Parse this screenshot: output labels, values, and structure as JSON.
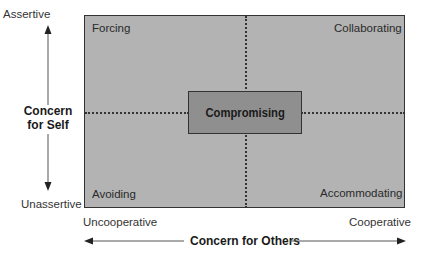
{
  "diagram": {
    "type": "conflict-modes-grid",
    "quadrants": {
      "top_left": "Forcing",
      "top_right": "Collaborating",
      "bottom_left": "Avoiding",
      "bottom_right": "Accommodating",
      "center": "Compromising"
    },
    "y_axis": {
      "title_line1": "Concern",
      "title_line2": "for Self",
      "top_label": "Assertive",
      "bottom_label": "Unassertive"
    },
    "x_axis": {
      "title": "Concern for Others",
      "left_label": "Uncooperative",
      "right_label": "Cooperative"
    },
    "colors": {
      "grid_fill": "#b3b3b3",
      "center_fill": "#8f8f8f",
      "border": "#333333"
    }
  }
}
